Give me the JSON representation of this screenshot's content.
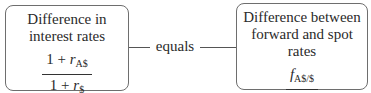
{
  "left_box": {
    "title_line1": "Difference in",
    "title_line2": "interest rates",
    "numerator": {
      "prefix": "1 + ",
      "var": "r",
      "sub": "A$"
    },
    "denominator": {
      "prefix": "1 + ",
      "var": "r",
      "sub": "$"
    }
  },
  "connector": {
    "label": "equals"
  },
  "right_box": {
    "title_line1": "Difference between",
    "title_line2": "forward and spot rates",
    "numerator": {
      "prefix": "",
      "var": "f",
      "sub": "A$/$"
    },
    "denominator": {
      "prefix": "",
      "var": "s",
      "sub": "A$/$"
    }
  }
}
